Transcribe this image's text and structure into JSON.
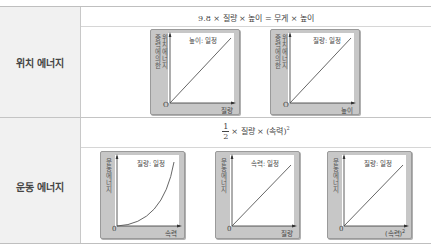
{
  "rows": [
    {
      "label": "위치 에너지",
      "formula": {
        "text": "9.8 × 질량 × 높이 = 무게 × 높이"
      },
      "graphs": [
        {
          "y_label_outer": "중력에의한",
          "y_label_inner": "위치에너지",
          "x_label": "질량",
          "origin": "O",
          "condition": "높이: 일정",
          "curve": "linear"
        },
        {
          "y_label_outer": "중력에의한",
          "y_label_inner": "위치에너지",
          "x_label": "높이",
          "origin": "O",
          "condition": "질량: 일정",
          "curve": "linear"
        }
      ]
    },
    {
      "label": "운동 에너지",
      "formula": {
        "frac_num": "1",
        "frac_den": "2",
        "text": "× 질량 × (속력)",
        "sup": "2"
      },
      "graphs": [
        {
          "y_label": "운동에너지",
          "x_label": "속력",
          "origin": "0",
          "condition": "질량: 일정",
          "curve": "quadratic"
        },
        {
          "y_label": "운동에너지",
          "x_label": "질량",
          "origin": "0",
          "condition": "속력: 일정",
          "curve": "linear"
        },
        {
          "y_label": "운동에너지",
          "x_label": "(속력)",
          "x_label_sup": "2",
          "origin": "0",
          "condition": "질량: 일정",
          "curve": "linear"
        }
      ]
    }
  ],
  "colors": {
    "left_column_bg": "#f1f1f1",
    "graph_frame": "#c7c7c7",
    "line": "#444444"
  }
}
